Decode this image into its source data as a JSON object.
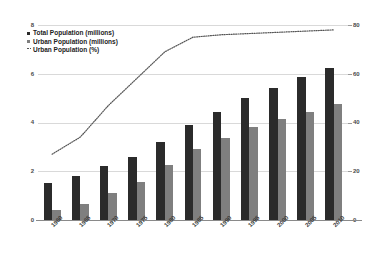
{
  "chart_data": {
    "type": "bar",
    "title": "",
    "subtitle": "",
    "xlabel": "",
    "ylabel": "",
    "y2label": "",
    "grid": true,
    "legend_position": "top-left",
    "categories": [
      "1960",
      "1965",
      "1970",
      "1975",
      "1980",
      "1985",
      "1990",
      "1995",
      "2000",
      "2005",
      "2010"
    ],
    "ylim": [
      0,
      8
    ],
    "yticks": [
      "0",
      "2",
      "4",
      "6",
      "8"
    ],
    "y2lim": [
      0,
      80
    ],
    "y2ticks": [
      "0",
      "20",
      "40",
      "60",
      "80"
    ],
    "series": [
      {
        "name": "Total Population (millions)",
        "axis": "left",
        "type": "bar",
        "color": "#2b2b2b",
        "values": [
          1.5,
          1.8,
          2.2,
          2.6,
          3.2,
          3.9,
          4.45,
          5.0,
          5.4,
          5.85,
          6.25
        ]
      },
      {
        "name": "Urban Population (millions)",
        "axis": "left",
        "type": "bar",
        "color": "#7f7f7f",
        "values": [
          0.4,
          0.65,
          1.1,
          1.55,
          2.25,
          2.9,
          3.35,
          3.8,
          4.15,
          4.45,
          4.75
        ]
      },
      {
        "name": "Urban Population (%)",
        "axis": "right",
        "type": "line",
        "style": "dotted",
        "color": "#555555",
        "values": [
          27,
          34,
          47,
          58,
          69,
          75,
          76,
          76.5,
          77,
          77.5,
          78
        ]
      }
    ]
  },
  "legend": {
    "items": [
      {
        "label": "Total Population (millions)",
        "marker": "square-dark"
      },
      {
        "label": "Urban Population (millions)",
        "marker": "square-gray"
      },
      {
        "label": "Urban Population (%)",
        "marker": "dotted-line"
      }
    ]
  }
}
